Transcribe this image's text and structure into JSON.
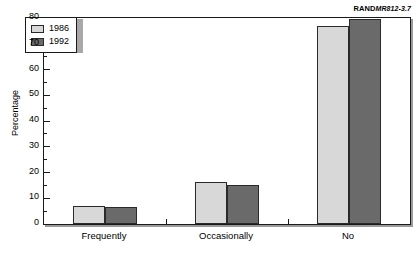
{
  "corner_label": {
    "brand": "RAND",
    "document": "MR812-3.7"
  },
  "chart_data": {
    "type": "bar",
    "title": "",
    "xlabel": "",
    "ylabel": "Percentage",
    "ylim": [
      0,
      80
    ],
    "ytick_values": [
      0,
      10,
      20,
      30,
      40,
      50,
      60,
      70,
      80
    ],
    "ytick_labels": [
      "0",
      "10",
      "20",
      "30",
      "40",
      "50",
      "60",
      "70",
      "80"
    ],
    "minor_tick_step": 5,
    "grid": false,
    "legend_position": "top-left",
    "categories": [
      "Frequently",
      "Occasionally",
      "No"
    ],
    "series": [
      {
        "name": "1986",
        "color": "#d8d8d8",
        "values": [
          7,
          16.5,
          77
        ]
      },
      {
        "name": "1992",
        "color": "#6a6a6a",
        "values": [
          6.5,
          15,
          79.5
        ]
      }
    ]
  }
}
